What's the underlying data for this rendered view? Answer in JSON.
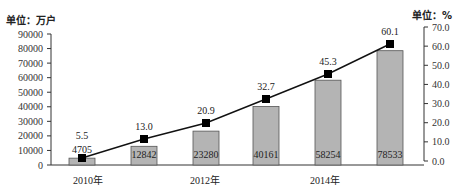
{
  "chart_data": {
    "type": "bar+line",
    "title": "",
    "left_axis": {
      "unit_label": "单位：万户",
      "ticks": [
        0,
        10000,
        20000,
        30000,
        40000,
        50000,
        60000,
        70000,
        80000,
        90000
      ],
      "ylim": [
        0,
        90000
      ]
    },
    "right_axis": {
      "unit_label": "单位：%",
      "ticks": [
        "0.0",
        "10.0",
        "20.0",
        "30.0",
        "40.0",
        "50.0",
        "60.0",
        "70.0"
      ],
      "ylim": [
        0,
        70
      ]
    },
    "x_tick_labels": [
      {
        "label": "2010年",
        "index": 0
      },
      {
        "label": "2012年",
        "index": 2
      },
      {
        "label": "2014年",
        "index": 4
      }
    ],
    "categories": [
      "2010",
      "2011",
      "2012",
      "2013",
      "2014",
      "2015"
    ],
    "series": [
      {
        "name": "users",
        "type": "bar",
        "axis": "left",
        "unit": "万户",
        "values": [
          4705,
          12842,
          23280,
          40161,
          58254,
          78533
        ],
        "labels": [
          "4705",
          "12842",
          "23280",
          "40161",
          "58254",
          "78533"
        ]
      },
      {
        "name": "percent",
        "type": "line",
        "axis": "right",
        "unit": "%",
        "values": [
          5.5,
          13.0,
          20.9,
          32.7,
          45.3,
          60.1
        ],
        "labels": [
          "5.5",
          "13.0",
          "20.9",
          "32.7",
          "45.3",
          "60.1"
        ]
      }
    ],
    "colors": {
      "bar_fill": "#b4b4b4",
      "bar_stroke": "#555555",
      "line": "#111111",
      "marker": "#000000",
      "axis": "#333333"
    },
    "grid": false,
    "legend": null
  }
}
